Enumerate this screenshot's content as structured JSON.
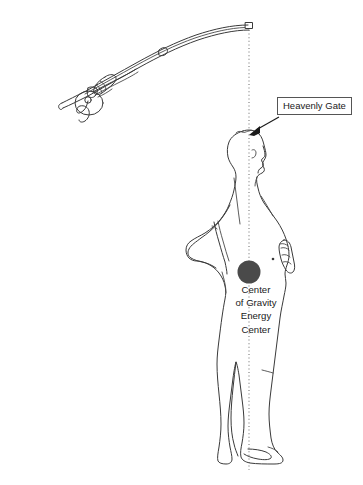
{
  "figure": {
    "background_color": "#ffffff",
    "line_color": "#3a3a3a",
    "plumb_line_color": "#777777",
    "accent_color": "#4a4a4a"
  },
  "callout": {
    "heavenly_gate_label": "Heavenly Gate"
  },
  "caption": {
    "lines": [
      "Center",
      "of Gravity",
      "Energy",
      "Center"
    ],
    "line_1": "Center",
    "line_2": "of Gravity",
    "line_3": "Energy",
    "line_4": "Center"
  },
  "objects": {
    "fishing_rod": "fishing-rod-with-reel",
    "human_figure": "standing-person-side-profile",
    "plumb_line": "vertical-dotted-alignment-line",
    "center_of_gravity_marker": "filled-dark-circle"
  }
}
